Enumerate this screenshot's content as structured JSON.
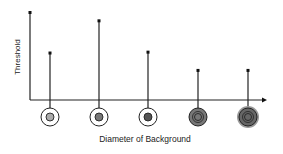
{
  "chart_data": {
    "type": "stem",
    "title": "",
    "xlabel": "Diameter of Background",
    "ylabel": "Threshold",
    "ylim": [
      0,
      1
    ],
    "grid": false,
    "legend": "none",
    "categories": [
      "background-1",
      "background-2",
      "background-3",
      "background-4",
      "background-5"
    ],
    "values": [
      0.54,
      0.91,
      0.55,
      0.34,
      0.34
    ],
    "markers": [
      {
        "center_color": "#aaaaaa",
        "ring_fill": "#ffffff",
        "halo": false
      },
      {
        "center_color": "#777777",
        "ring_fill": "#ffffff",
        "halo": false
      },
      {
        "center_color": "#555555",
        "ring_fill": "#ffffff",
        "halo": false
      },
      {
        "center_color": "#777777",
        "ring_fill": "#777777",
        "halo": false
      },
      {
        "center_color": "#777777",
        "ring_fill": "#666666",
        "halo": true
      }
    ]
  },
  "colors": {
    "axis": "#222222",
    "stem": "#222222"
  }
}
